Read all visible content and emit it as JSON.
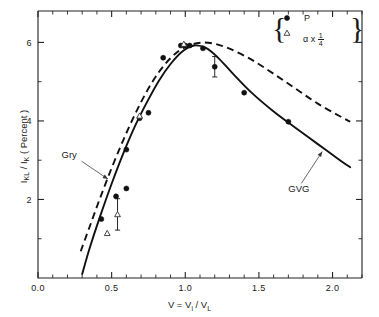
{
  "figure": {
    "background": "#ffffff",
    "foreground": "#111111"
  },
  "chart_data": {
    "type": "scatter",
    "title": "",
    "subtitle": "",
    "xlabel": "V = V_i / V_L",
    "ylabel": "I_KL / I_K  (Percent)",
    "xlim": [
      0.0,
      2.2
    ],
    "ylim": [
      0.0,
      6.8
    ],
    "xticks": [
      0.0,
      0.5,
      1.0,
      1.5,
      2.0
    ],
    "xtick_labels": [
      "0.0",
      "0.5",
      "1.0",
      "1.5",
      "2.0"
    ],
    "xminor_step": 0.1,
    "yticks": [
      2,
      4,
      6
    ],
    "ytick_labels": [
      "2",
      "4",
      "6"
    ],
    "yminor_step": 1,
    "grid": false,
    "legend_position": "top-right",
    "series": [
      {
        "name": "P",
        "marker": "filled-circle",
        "type": "scatter",
        "points": [
          {
            "x": 0.43,
            "y": 1.5,
            "err": 0.0
          },
          {
            "x": 0.53,
            "y": 2.08,
            "err": 0.0
          },
          {
            "x": 0.6,
            "y": 2.28,
            "err": 0.0
          },
          {
            "x": 0.6,
            "y": 3.27,
            "err": 0.0
          },
          {
            "x": 0.69,
            "y": 4.07,
            "err": 0.0
          },
          {
            "x": 0.75,
            "y": 4.21,
            "err": 0.0
          },
          {
            "x": 0.85,
            "y": 5.61,
            "err": 0.0
          },
          {
            "x": 0.97,
            "y": 5.92,
            "err": 0.0
          },
          {
            "x": 1.0,
            "y": 5.92,
            "err": 0.0
          },
          {
            "x": 1.03,
            "y": 5.92,
            "err": 0.0
          },
          {
            "x": 1.12,
            "y": 5.85,
            "err": 0.0
          },
          {
            "x": 1.2,
            "y": 5.38,
            "err": 0.26
          },
          {
            "x": 1.4,
            "y": 4.72,
            "err": 0.0
          },
          {
            "x": 1.7,
            "y": 3.98,
            "err": 0.0
          }
        ]
      },
      {
        "name": "alpha x 1/4",
        "marker": "open-triangle",
        "type": "scatter",
        "points": [
          {
            "x": 0.47,
            "y": 1.14,
            "err": 0.0
          },
          {
            "x": 0.54,
            "y": 1.62,
            "err": 0.4
          },
          {
            "x": 0.69,
            "y": 4.13,
            "err": 0.0
          },
          {
            "x": 0.99,
            "y": 5.96,
            "err": 0.0
          }
        ]
      },
      {
        "name": "GVG",
        "type": "line",
        "style": "solid",
        "points": [
          {
            "x": 0.3,
            "y": 0.1
          },
          {
            "x": 0.35,
            "y": 0.75
          },
          {
            "x": 0.42,
            "y": 1.55
          },
          {
            "x": 0.5,
            "y": 2.4
          },
          {
            "x": 0.58,
            "y": 3.18
          },
          {
            "x": 0.66,
            "y": 3.88
          },
          {
            "x": 0.74,
            "y": 4.48
          },
          {
            "x": 0.82,
            "y": 5.02
          },
          {
            "x": 0.9,
            "y": 5.45
          },
          {
            "x": 0.98,
            "y": 5.77
          },
          {
            "x": 1.06,
            "y": 5.92
          },
          {
            "x": 1.14,
            "y": 5.86
          },
          {
            "x": 1.22,
            "y": 5.62
          },
          {
            "x": 1.32,
            "y": 5.22
          },
          {
            "x": 1.45,
            "y": 4.72
          },
          {
            "x": 1.6,
            "y": 4.24
          },
          {
            "x": 1.75,
            "y": 3.82
          },
          {
            "x": 1.9,
            "y": 3.41
          },
          {
            "x": 2.05,
            "y": 3.0
          },
          {
            "x": 2.12,
            "y": 2.82
          }
        ]
      },
      {
        "name": "Gry",
        "type": "line",
        "style": "dashed",
        "points": [
          {
            "x": 0.29,
            "y": 0.68
          },
          {
            "x": 0.35,
            "y": 1.3
          },
          {
            "x": 0.42,
            "y": 2.02
          },
          {
            "x": 0.5,
            "y": 2.8
          },
          {
            "x": 0.58,
            "y": 3.52
          },
          {
            "x": 0.66,
            "y": 4.18
          },
          {
            "x": 0.74,
            "y": 4.76
          },
          {
            "x": 0.82,
            "y": 5.24
          },
          {
            "x": 0.9,
            "y": 5.6
          },
          {
            "x": 0.98,
            "y": 5.84
          },
          {
            "x": 1.08,
            "y": 5.98
          },
          {
            "x": 1.18,
            "y": 5.98
          },
          {
            "x": 1.3,
            "y": 5.84
          },
          {
            "x": 1.45,
            "y": 5.56
          },
          {
            "x": 1.6,
            "y": 5.2
          },
          {
            "x": 1.75,
            "y": 4.82
          },
          {
            "x": 1.9,
            "y": 4.44
          },
          {
            "x": 2.05,
            "y": 4.12
          },
          {
            "x": 2.12,
            "y": 3.98
          }
        ]
      }
    ],
    "annotations": [
      {
        "id": "gry",
        "text": "Gry",
        "label_x": 0.16,
        "label_y": 3.05,
        "target_x": 0.475,
        "target_y": 2.52
      },
      {
        "id": "gvg",
        "text": "GVG",
        "label_x": 1.7,
        "label_y": 2.18,
        "target_x": 1.93,
        "target_y": 3.22
      }
    ]
  },
  "axes": {
    "xlabel_text": "V = V",
    "xlabel_sub1": "i",
    "xlabel_mid": " / V",
    "xlabel_sub2": "L",
    "ylabel_main1": "I",
    "ylabel_sub1": "KL",
    "ylabel_mid": " / I",
    "ylabel_sub2": "K",
    "ylabel_tail": "  ( Percent )",
    "xtick_labels": [
      "0.0",
      "0.5",
      "1.0",
      "1.5",
      "2.0"
    ],
    "ytick_labels": [
      "6",
      "4",
      "2"
    ]
  },
  "legend": {
    "brace_left": "{",
    "brace_right": "}",
    "entries": [
      {
        "marker": "filled-circle",
        "label": "P"
      },
      {
        "marker": "open-triangle",
        "label_prefix": "α x ",
        "frac_num": "1",
        "frac_den": "4"
      }
    ]
  }
}
